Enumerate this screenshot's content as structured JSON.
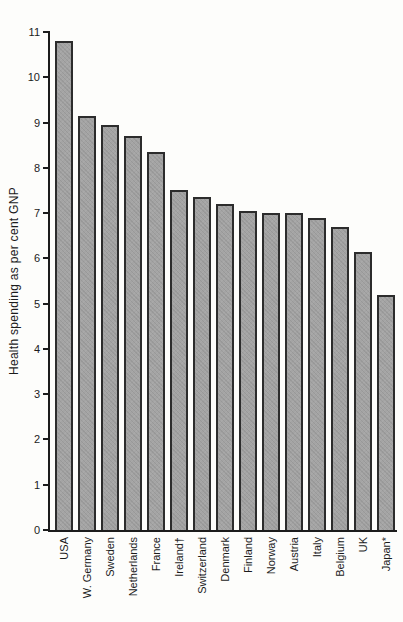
{
  "figure": {
    "background_color": "#fdfdfb",
    "text_color": "#1b1b1b"
  },
  "chart_data": {
    "type": "bar",
    "title": "",
    "xlabel": "",
    "ylabel": "Health spending as per cent GNP",
    "ylim": [
      0,
      11
    ],
    "yticks": [
      0,
      1,
      2,
      3,
      4,
      5,
      6,
      7,
      8,
      9,
      10,
      11
    ],
    "grid": false,
    "legend": "none",
    "categories": [
      "USA",
      "W. Germany",
      "Sweden",
      "Netherlands",
      "France",
      "Ireland†",
      "Switzerland",
      "Denmark",
      "Finland",
      "Norway",
      "Austria",
      "Italy",
      "Belgium",
      "UK",
      "Japan*"
    ],
    "values": [
      10.8,
      9.15,
      8.95,
      8.7,
      8.35,
      7.5,
      7.35,
      7.2,
      7.05,
      7.0,
      7.0,
      6.9,
      6.7,
      6.15,
      5.2
    ],
    "bar_color": "#a4a4a4",
    "bar_border_color": "#2c2c2c",
    "axis_color": "#1c1c1c"
  }
}
